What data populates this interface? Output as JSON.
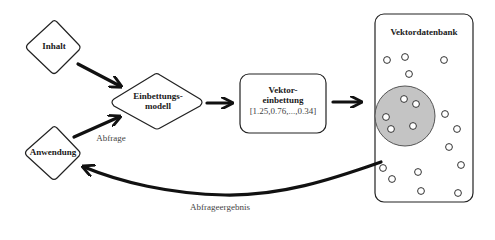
{
  "nodes": {
    "content": {
      "label": "Inhalt"
    },
    "application": {
      "label": "Anwendung"
    },
    "embedding_model": {
      "line1": "Einbettungs-",
      "line2": "modell"
    },
    "vector_embedding": {
      "line1": "Vektor-",
      "line2": "einbettung",
      "value": "[1.25,0.76,...,0.34]"
    },
    "vector_db": {
      "title": "Vektordatenbank"
    }
  },
  "edges": {
    "query_label": "Abfrage",
    "result_label": "Abfrageergebnis"
  },
  "colors": {
    "stroke": "#1a1a1a",
    "cluster_fill": "#c4c4c4",
    "background": "#ffffff"
  }
}
